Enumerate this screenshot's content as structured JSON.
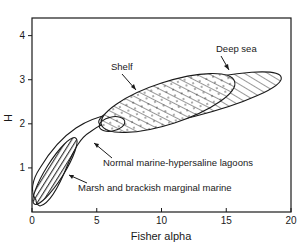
{
  "chart_data": {
    "type": "scatter",
    "subtype": "field-diagram",
    "title": "",
    "xlabel": "Fisher alpha",
    "ylabel": "H",
    "xlim": [
      0,
      20
    ],
    "ylim": [
      0,
      4.4
    ],
    "xticks": [
      0,
      5,
      10,
      15,
      20
    ],
    "yticks": [
      1,
      2,
      3,
      4
    ],
    "xtick_labels": [
      "0",
      "5",
      "10",
      "15",
      "20"
    ],
    "ytick_labels": [
      "1",
      "2",
      "3",
      "4"
    ],
    "grid": false,
    "legend": null,
    "regions": [
      {
        "name": "Normal marine-hypersaline lagoons",
        "fill": "none",
        "shape": "curved band",
        "approx_extent": {
          "alpha": [
            0.2,
            6.5
          ],
          "H": [
            0.2,
            2.2
          ]
        }
      },
      {
        "name": "Marsh and brackish marginal marine",
        "fill": "horizontal hatch",
        "shape": "ellipse",
        "approx_center": {
          "alpha": 1.7,
          "H": 0.95
        },
        "approx_extent": {
          "alpha": [
            0.2,
            3.3
          ],
          "H": [
            0.2,
            1.7
          ]
        }
      },
      {
        "name": "Shelf",
        "fill": "dots + diagonal hatch",
        "shape": "ellipse",
        "approx_center": {
          "alpha": 10.5,
          "H": 2.55
        },
        "approx_extent": {
          "alpha": [
            5.2,
            15.5
          ],
          "H": [
            1.9,
            3.1
          ]
        }
      },
      {
        "name": "Deep sea",
        "fill": "diagonal hatch",
        "shape": "ellipse",
        "approx_center": {
          "alpha": 12.5,
          "H": 2.6
        },
        "approx_extent": {
          "alpha": [
            5.5,
            19.2
          ],
          "H": [
            1.9,
            3.3
          ]
        }
      }
    ],
    "annotations": [
      {
        "text": "Shelf",
        "label_at": {
          "alpha": 8.3,
          "H": 3.2
        },
        "arrow_to": {
          "alpha": 10.3,
          "H": 2.75
        }
      },
      {
        "text": "Deep sea",
        "label_at": {
          "alpha": 14.6,
          "H": 3.7
        },
        "arrow_to": {
          "alpha": 16.0,
          "H": 3.25
        }
      },
      {
        "text": "Normal marine-hypersaline lagoons",
        "label_at": {
          "alpha": 5.5,
          "H": 1.15
        },
        "arrow_to": {
          "alpha": 4.5,
          "H": 1.58
        }
      },
      {
        "text": "Marsh and brackish marginal marine",
        "label_at": {
          "alpha": 3.5,
          "H": 0.5
        },
        "arrow_to": {
          "alpha": 2.5,
          "H": 0.85
        }
      }
    ]
  }
}
